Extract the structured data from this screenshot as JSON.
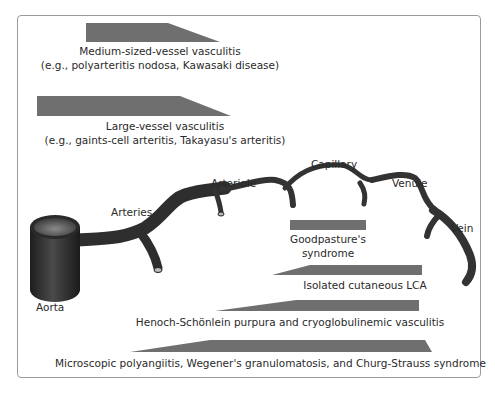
{
  "colors": {
    "bar_fill": "#6f6f6f",
    "vessel_fill": "#3a3a3a",
    "frame_border": "#9a9a9a",
    "text": "#2a2a2a"
  },
  "categories": {
    "medium": {
      "title": "Medium-sized-vessel vasculitis",
      "examples": "(e.g., polyarteritis nodosa, Kawasaki disease)"
    },
    "large": {
      "title": "Large-vessel vasculitis",
      "examples": "(e.g., gaints-cell arteritis, Takayasu's arteritis)"
    },
    "goodpasture": {
      "line1": "Goodpasture's",
      "line2": "syndrome"
    },
    "cutaneous": {
      "title": "Isolated cutaneous LCA"
    },
    "henoch": {
      "title": "Henoch-Schönlein purpura and cryoglobulinemic vasculitis"
    },
    "microscopic": {
      "title": "Microscopic polyangiitis, Wegener's granulomatosis, and Churg-Strauss syndrome"
    }
  },
  "vessels": {
    "aorta": "Aorta",
    "arteries": "Arteries",
    "arteriole": "Arteriole",
    "capillary": "Capillary",
    "venule": "Venule",
    "vein": "Vein"
  }
}
